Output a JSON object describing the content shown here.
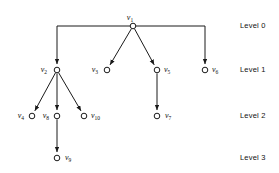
{
  "diagram": {
    "type": "rooted-tree",
    "colors": {
      "background": "#ffffff",
      "stroke": "#1a1a1a",
      "node_fill": "#ffffff",
      "text": "#111111"
    },
    "nodes": [
      {
        "id": "v1",
        "label_base": "v",
        "label_sub": "1",
        "x": 133,
        "y": 26,
        "level": 0,
        "label_x": 130,
        "label_y": 18,
        "label_anchor": "middle"
      },
      {
        "id": "v2",
        "label_base": "v",
        "label_sub": "2",
        "x": 57,
        "y": 70,
        "level": 1,
        "label_x": 47,
        "label_y": 70,
        "label_anchor": "end"
      },
      {
        "id": "v3",
        "label_base": "v",
        "label_sub": "3",
        "x": 107,
        "y": 70,
        "level": 1,
        "label_x": 98,
        "label_y": 70,
        "label_anchor": "end"
      },
      {
        "id": "v5",
        "label_base": "v",
        "label_sub": "5",
        "x": 157,
        "y": 70,
        "level": 1,
        "label_x": 164,
        "label_y": 70,
        "label_anchor": "start"
      },
      {
        "id": "v6",
        "label_base": "v",
        "label_sub": "6",
        "x": 205,
        "y": 70,
        "level": 1,
        "label_x": 212,
        "label_y": 70,
        "label_anchor": "start"
      },
      {
        "id": "v4",
        "label_base": "v",
        "label_sub": "4",
        "x": 32,
        "y": 116,
        "level": 2,
        "label_x": 24,
        "label_y": 116,
        "label_anchor": "end"
      },
      {
        "id": "v8",
        "label_base": "v",
        "label_sub": "8",
        "x": 57,
        "y": 116,
        "level": 2,
        "label_x": 49,
        "label_y": 116,
        "label_anchor": "end"
      },
      {
        "id": "v10",
        "label_base": "v",
        "label_sub": "10",
        "x": 84,
        "y": 116,
        "level": 2,
        "label_x": 91,
        "label_y": 116,
        "label_anchor": "start"
      },
      {
        "id": "v7",
        "label_base": "v",
        "label_sub": "7",
        "x": 157,
        "y": 116,
        "level": 2,
        "label_x": 165,
        "label_y": 116,
        "label_anchor": "start"
      },
      {
        "id": "v9",
        "label_base": "v",
        "label_sub": "9",
        "x": 57,
        "y": 158,
        "level": 3,
        "label_x": 65,
        "label_y": 158,
        "label_anchor": "start"
      }
    ],
    "edges": [
      {
        "from": "v1",
        "to": "v2",
        "style": "elbow",
        "corner_y": 26
      },
      {
        "from": "v1",
        "to": "v3",
        "style": "straight"
      },
      {
        "from": "v1",
        "to": "v5",
        "style": "straight"
      },
      {
        "from": "v1",
        "to": "v6",
        "style": "elbow",
        "corner_y": 26
      },
      {
        "from": "v2",
        "to": "v4",
        "style": "straight"
      },
      {
        "from": "v2",
        "to": "v8",
        "style": "straight"
      },
      {
        "from": "v2",
        "to": "v10",
        "style": "straight"
      },
      {
        "from": "v5",
        "to": "v7",
        "style": "straight"
      },
      {
        "from": "v8",
        "to": "v9",
        "style": "straight"
      }
    ],
    "levels": [
      {
        "text": "Level 0",
        "y": 26,
        "x": 240
      },
      {
        "text": "Level 1",
        "y": 70,
        "x": 240
      },
      {
        "text": "Level 2",
        "y": 116,
        "x": 240
      },
      {
        "text": "Level 3",
        "y": 158,
        "x": 240
      }
    ]
  }
}
